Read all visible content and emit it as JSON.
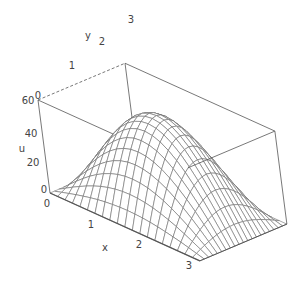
{
  "chart_data": {
    "type": "surface3d",
    "title": "",
    "function_description": "u(x,y) ≈ 60·sin(x)·sin(y) over 0 ≤ x ≤ π, 0 ≤ y ≤ π",
    "xlabel": "x",
    "ylabel": "y",
    "zlabel": "u",
    "xlim": [
      0,
      3.14159
    ],
    "ylim": [
      0,
      3.14159
    ],
    "zlim": [
      0,
      60
    ],
    "x_ticks": [
      "0",
      "1",
      "2",
      "3"
    ],
    "y_ticks": [
      "0",
      "1",
      "2",
      "3"
    ],
    "z_ticks": [
      "0",
      "20",
      "40",
      "60"
    ],
    "mesh_resolution": [
      20,
      20
    ],
    "peak": {
      "x": 1.5708,
      "y": 1.5708,
      "u": 60
    },
    "box": true,
    "grid": false,
    "legend": null
  },
  "projection": {
    "origin": [
      50,
      193
    ],
    "x_unit": [
      47.7,
      21.6
    ],
    "y_unit": [
      27.7,
      -11.7
    ],
    "u_unit": [
      -0.2,
      -1.55
    ]
  },
  "labels": {
    "x_axis": {
      "text": "x",
      "pos": [
        105,
        251
      ]
    },
    "y_axis": {
      "text": "y",
      "pos": [
        88,
        39
      ]
    },
    "u_axis": {
      "text": "u",
      "pos": [
        22,
        152
      ]
    },
    "x_ticks": [
      {
        "text": "0",
        "pos": [
          47,
          207
        ]
      },
      {
        "text": "1",
        "pos": [
          91,
          228
        ]
      },
      {
        "text": "2",
        "pos": [
          139,
          248
        ]
      },
      {
        "text": "3",
        "pos": [
          189,
          269
        ]
      }
    ],
    "y_ticks": [
      {
        "text": "0",
        "pos": [
          38,
          99
        ]
      },
      {
        "text": "1",
        "pos": [
          72,
          69
        ]
      },
      {
        "text": "2",
        "pos": [
          102,
          45
        ]
      },
      {
        "text": "3",
        "pos": [
          131,
          23
        ]
      }
    ],
    "u_ticks": [
      {
        "text": "60",
        "pos": [
          28,
          104
        ]
      },
      {
        "text": "40",
        "pos": [
          31,
          137
        ]
      },
      {
        "text": "20",
        "pos": [
          33,
          166
        ]
      },
      {
        "text": "0",
        "pos": [
          44,
          193
        ]
      }
    ]
  },
  "colors": {
    "mesh": "#6b6b6b",
    "box": "#555555",
    "text": "#444444",
    "background": "#ffffff"
  }
}
